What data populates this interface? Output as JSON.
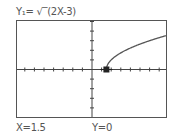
{
  "screen": {
    "equation_label": "Y₁= √‾(2X-3)",
    "trace": {
      "x_label": "X=1.5",
      "y_label": "Y=0"
    }
  },
  "chart_data": {
    "type": "line",
    "function": "sqrt(2X-3)",
    "series": [
      {
        "name": "Y1",
        "x": [
          1.5,
          2,
          2.5,
          3,
          4,
          5,
          6,
          7,
          7.8
        ],
        "values": [
          0,
          1,
          1.414,
          1.732,
          2.236,
          2.646,
          3.0,
          3.317,
          3.55
        ]
      }
    ],
    "xlabel": "",
    "ylabel": "",
    "xlim": [
      -7.8,
      7.8
    ],
    "ylim": [
      -5.1,
      5.1
    ],
    "xscl": 1,
    "yscl": 1,
    "grid": false,
    "legend": "none",
    "trace_point": {
      "x": 1.5,
      "y": 0
    }
  },
  "colors": {
    "frame": "#555555",
    "axis": "#444444",
    "curve": "#555555",
    "cursor": "#222222"
  }
}
